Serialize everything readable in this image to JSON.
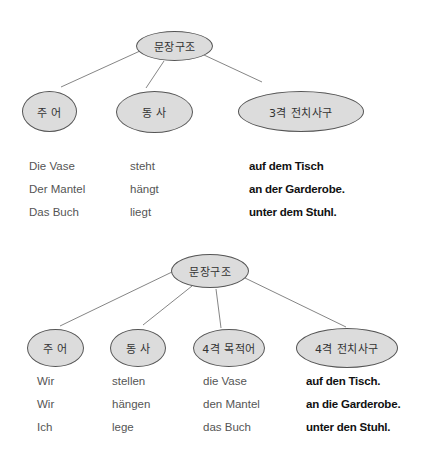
{
  "diagram1": {
    "root": "문장구조",
    "children": [
      "주  어",
      "동  사",
      "3격 전치사구"
    ],
    "rows": [
      {
        "subject": "Die Vase",
        "verb": "steht",
        "prep": "auf dem Tisch"
      },
      {
        "subject": "Der Mantel",
        "verb": "hängt",
        "prep": "an der Garderobe."
      },
      {
        "subject": "Das Buch",
        "verb": "liegt",
        "prep": "unter dem Stuhl."
      }
    ]
  },
  "diagram2": {
    "root": "문장구조",
    "children": [
      "주  어",
      "동 사",
      "4격 목적어",
      "4격 전치사구"
    ],
    "rows": [
      {
        "subject": "Wir",
        "verb": "stellen",
        "object": "die Vase",
        "prep": "auf den Tisch."
      },
      {
        "subject": "Wir",
        "verb": "hängen",
        "object": "den Mantel",
        "prep": "an die Garderobe."
      },
      {
        "subject": "Ich",
        "verb": "lege",
        "object": "das Buch",
        "prep": "unter den Stuhl."
      }
    ]
  },
  "colors": {
    "node_fill": "#dcdcdc",
    "node_border": "#555555",
    "line": "#666666"
  }
}
